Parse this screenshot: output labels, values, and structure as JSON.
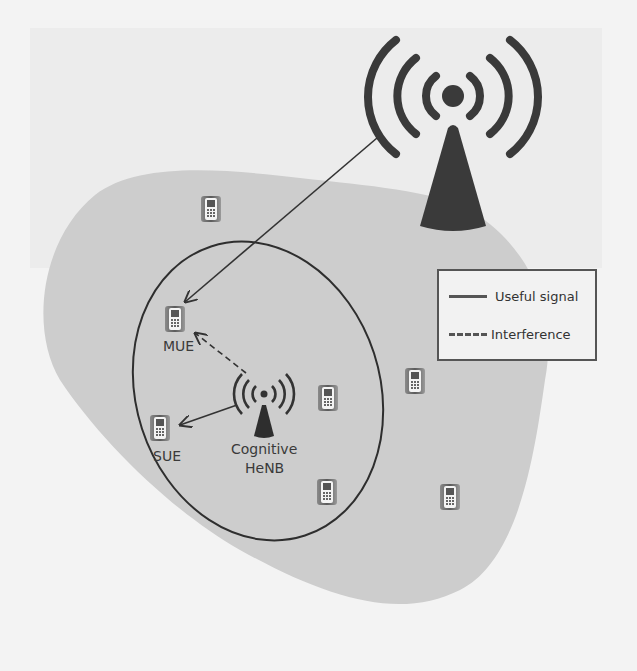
{
  "diagram": {
    "title": "",
    "nodes": {
      "enb": {
        "label": "eNB"
      },
      "henb": {
        "label_line1": "Cognitive",
        "label_line2": "HeNB"
      },
      "mue": {
        "label": "MUE"
      },
      "sue": {
        "label": "SUE"
      }
    },
    "legend": {
      "useful_signal": "Useful signal",
      "interference": "Interference"
    },
    "edges": [
      {
        "from": "eNB",
        "to": "MUE",
        "type": "Useful signal"
      },
      {
        "from": "Cognitive HeNB",
        "to": "SUE",
        "type": "Useful signal"
      },
      {
        "from": "Cognitive HeNB",
        "to": "MUE",
        "type": "Interference"
      }
    ],
    "colors": {
      "macro_cell": "#cfcfcf",
      "background": "#f3f3f3",
      "ink": "#3a3a3a"
    }
  }
}
